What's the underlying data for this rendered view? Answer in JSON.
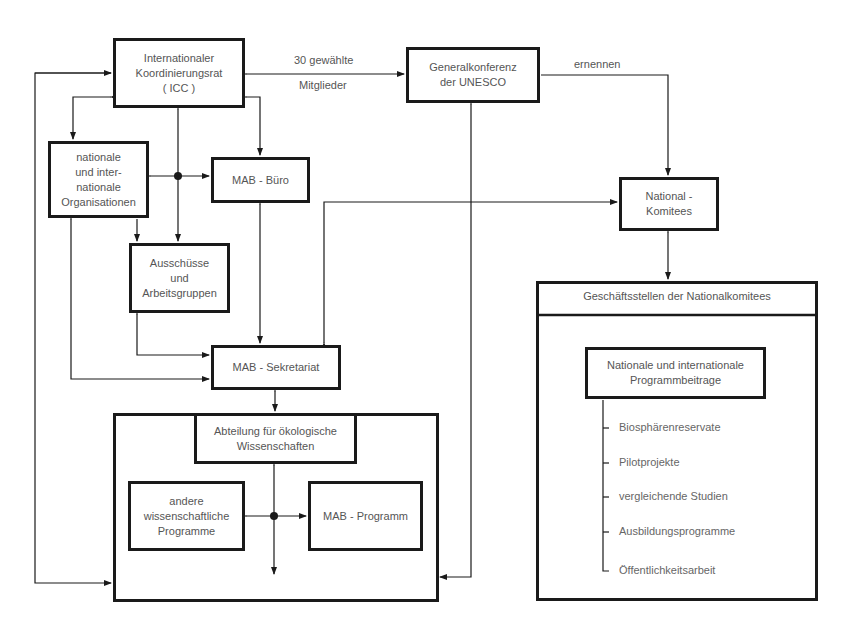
{
  "diagram": {
    "nodes": {
      "icc": "Internationaler\nKoordinierungsrat\n( ICC )",
      "general_conference": "Generalkonferenz\nder UNESCO",
      "national_orgs": "nationale\nund inter-\nnationale\nOrganisationen",
      "mab_buero": "MAB - Büro",
      "committees": "Ausschüsse\nund\nArbeitsgruppen",
      "mab_secretariat": "MAB - Sekretariat",
      "ecology_division": "Abteilung für ökologische\nWissenschaften",
      "other_programs": "andere\nwissenschaftliche\nProgramme",
      "mab_program": "MAB - Programm",
      "national_committees": "National -\nKomitees",
      "offices_header": "Geschäftsstellen der Nationalkomitees",
      "contributions": "Nationale und internationale\nProgrammbeitrage"
    },
    "edge_labels": {
      "elected_top": "30 gewählte",
      "elected_bottom": "Mitglieder",
      "appoint": "ernennen"
    },
    "contribution_items": [
      "Biosphärenreservate",
      "Pilotprojekte",
      "vergleichende Studien",
      "Ausbildungsprogramme",
      "Öffentlichkeitsarbeit"
    ],
    "colors": {
      "line": "#1a1a1a",
      "text": "#555555",
      "background": "#ffffff"
    }
  }
}
